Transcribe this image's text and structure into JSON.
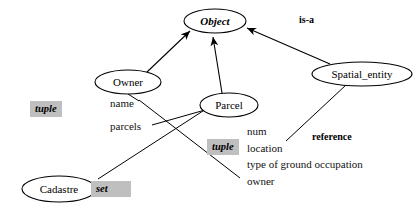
{
  "diagram": {
    "type": "entity-class-diagram",
    "nodes": [
      {
        "id": "object",
        "label": "Object",
        "style": "bold-italic",
        "cx": 215,
        "cy": 21,
        "rx": 31,
        "ry": 12
      },
      {
        "id": "owner",
        "label": "Owner",
        "style": "regular",
        "cx": 128,
        "cy": 82,
        "rx": 33,
        "ry": 12
      },
      {
        "id": "parcel",
        "label": "Parcel",
        "style": "regular",
        "cx": 229,
        "cy": 105,
        "rx": 29,
        "ry": 12
      },
      {
        "id": "spatial_entity",
        "label": "Spatial_entity",
        "style": "regular",
        "cx": 362,
        "cy": 74,
        "rx": 50,
        "ry": 12
      },
      {
        "id": "cadastre",
        "label": "Cadastre",
        "style": "regular",
        "cx": 59,
        "cy": 189,
        "rx": 37,
        "ry": 13
      }
    ],
    "type_badges": [
      {
        "id": "owner-tuple",
        "label": "tuple",
        "x": 30,
        "y": 101
      },
      {
        "id": "parcel-tuple",
        "label": "tuple",
        "x": 207,
        "y": 139
      },
      {
        "id": "cadastre-set",
        "label": "set",
        "x": 91,
        "y": 181
      }
    ],
    "relation_labels": [
      {
        "id": "is-a",
        "label": "is-a",
        "x": 299,
        "y": 14
      },
      {
        "id": "reference",
        "label": "reference",
        "x": 312,
        "y": 131
      }
    ],
    "owner_attributes": [
      {
        "name": "name",
        "x": 110,
        "y": 103
      },
      {
        "name": "parcels",
        "x": 110,
        "y": 126
      }
    ],
    "parcel_attributes": [
      {
        "name": "num",
        "x": 247,
        "y": 131
      },
      {
        "name": "location",
        "x": 247,
        "y": 148
      },
      {
        "name": "type of ground occupation",
        "x": 247,
        "y": 164
      },
      {
        "name": "owner",
        "x": 247,
        "y": 181
      }
    ],
    "colors": {
      "stroke": "#000000",
      "badge_background": "#bfbfbf",
      "page_background": "#ffffff"
    }
  }
}
